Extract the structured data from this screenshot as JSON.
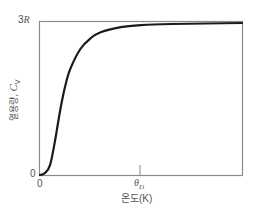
{
  "chart_data": {
    "type": "line",
    "title": "",
    "xlabel": "온도(K)",
    "ylabel": "열용량, C_V",
    "ylabel_text": "열용량, ",
    "ylabel_symbol": "C",
    "ylabel_subscript": "V",
    "x_ticks": [
      {
        "label": "0",
        "position": 0
      },
      {
        "label": "θ_D",
        "symbol": "θ",
        "subscript": "D",
        "position": 1.0
      }
    ],
    "y_ticks": [
      {
        "label": "0",
        "value": 0
      },
      {
        "label": "3R",
        "number": "3",
        "symbol": "R",
        "value": 3
      }
    ],
    "xlim": [
      0,
      2.0
    ],
    "ylim": [
      0,
      3
    ],
    "grid": false,
    "legend": null,
    "series": [
      {
        "name": "Debye heat capacity",
        "color": "#1a1a1a",
        "x": [
          0,
          0.05,
          0.1,
          0.15,
          0.2,
          0.25,
          0.3,
          0.4,
          0.5,
          0.6,
          0.8,
          1.0,
          1.3,
          2.0
        ],
        "y": [
          0,
          0.04,
          0.2,
          0.68,
          1.27,
          1.75,
          2.08,
          2.47,
          2.68,
          2.8,
          2.9,
          2.94,
          2.96,
          2.98
        ]
      }
    ]
  },
  "labels": {
    "y_top_number": "3",
    "y_top_symbol": "R",
    "y_zero": "0",
    "x_zero": "0",
    "x_theta": "θ",
    "x_theta_sub": "D",
    "xlabel": "온도(K)",
    "ylabel_text": "열용량, ",
    "ylabel_symbol": "C",
    "ylabel_sub": "V"
  },
  "colors": {
    "axis": "#8a8a8a",
    "curve": "#1a1a1a",
    "text": "#555555"
  }
}
